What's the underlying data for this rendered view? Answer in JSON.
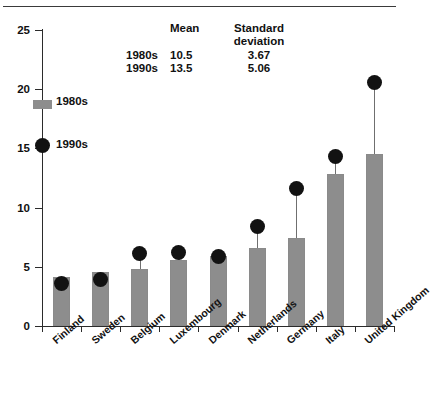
{
  "figure": {
    "top_rule": true,
    "caption_fragment": ""
  },
  "legend": {
    "items": [
      {
        "key": "bar",
        "label": "1980s",
        "marker": "gray-square-swatch",
        "color": "#8d8d8d"
      },
      {
        "key": "dot",
        "label": "1990s",
        "marker": "black-circle",
        "color": "#121212"
      }
    ]
  },
  "stats_table": {
    "headers": {
      "corner": "",
      "mean": "Mean",
      "sd_line1": "Standard",
      "sd_line2": "deviation"
    },
    "rows": [
      {
        "label": "1980s",
        "mean": "10.5",
        "sd": "3.67"
      },
      {
        "label": "1990s",
        "mean": "13.5",
        "sd": "5.06"
      }
    ]
  },
  "chart_data": {
    "type": "bar",
    "title": "",
    "subtitle": "",
    "xlabel": "",
    "ylabel": "",
    "ylim": [
      0,
      25
    ],
    "yticks": [
      0,
      5,
      10,
      15,
      20,
      25
    ],
    "ytick_labels": [
      "0",
      "5",
      "10",
      "15",
      "20",
      "25"
    ],
    "grid": false,
    "legend_position": "upper-left",
    "categories": [
      "Finland",
      "Sweden",
      "Belgium",
      "Luxembourg",
      "Denmark",
      "Netherlands",
      "Germany",
      "Italy",
      "United Kingdom"
    ],
    "series": [
      {
        "name": "1980s",
        "render": "bar",
        "color": "#8d8d8d",
        "values": [
          4.1,
          4.6,
          4.8,
          5.6,
          5.9,
          6.6,
          7.4,
          12.8,
          14.5
        ]
      },
      {
        "name": "1990s",
        "render": "dot",
        "color": "#121212",
        "values": [
          3.6,
          3.9,
          6.1,
          6.2,
          5.9,
          8.4,
          11.6,
          14.3,
          20.6
        ]
      }
    ],
    "summary": {
      "1980s": {
        "mean": 10.5,
        "sd": 3.67
      },
      "1990s": {
        "mean": 13.5,
        "sd": 5.06
      }
    }
  }
}
